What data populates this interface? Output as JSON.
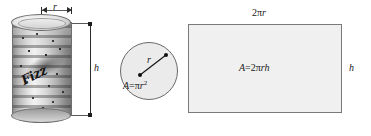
{
  "figure": {
    "background_color": "#ffffff"
  },
  "cylinder": {
    "name": "beverage-can",
    "radius_label": "r",
    "height_label": "h",
    "brand_script": "Fizz",
    "body_color": "#c9c9c9",
    "outline_color": "#6d6d6d"
  },
  "circle": {
    "name": "top-circle",
    "radius_label": "r",
    "area_label_prefix": "A",
    "area_label_equals": "=",
    "area_label_pi": "π",
    "area_label_r": "r",
    "area_label_exponent": "2",
    "area_label_full": "A = πr²",
    "fill_color": "#ebebeb",
    "outline_color": "#6a6a6a"
  },
  "rectangle": {
    "name": "unrolled-lateral-surface",
    "top_label_number": "2",
    "top_label_pi": "π",
    "top_label_r": "r",
    "top_label_full": "2πr",
    "side_label": "h",
    "area_label_A": "A",
    "area_label_equals": "=",
    "area_label_2": "2",
    "area_label_pi": "π",
    "area_label_rh": "rh",
    "area_label_full": "A = 2πrh",
    "fill_color": "#f0f0f0",
    "outline_color": "#7a7a7a"
  }
}
